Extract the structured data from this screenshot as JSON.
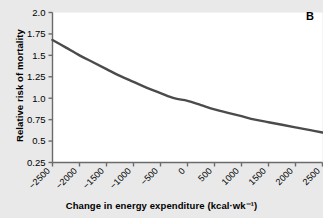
{
  "panel": {
    "label": "B"
  },
  "chart_data": {
    "type": "line",
    "title": "",
    "xlabel": "Change in energy expenditure (kcal·wk⁻¹)",
    "ylabel": "Relative risk of mortality",
    "xlim": [
      -2500,
      2500
    ],
    "ylim": [
      0.25,
      2.0
    ],
    "grid": false,
    "legend": null,
    "xticks": [
      -2500,
      -2000,
      -1500,
      -1000,
      -500,
      0,
      500,
      1000,
      1500,
      2000,
      2500
    ],
    "xticklabels": [
      "−2500",
      "−2000",
      "−1500",
      "−1000",
      "−500",
      "0",
      "500",
      "1000",
      "1500",
      "2000",
      "2500"
    ],
    "yticks": [
      0.25,
      0.5,
      0.75,
      1.0,
      1.25,
      1.5,
      1.75,
      2.0
    ],
    "yticklabels": [
      "0.25",
      "0.5",
      "0.75",
      "1.0",
      "1.25",
      "1.5",
      "1.75",
      "2.0"
    ],
    "series": [
      {
        "name": "Relative risk of mortality",
        "color": "#4b4b4b",
        "linewidth": 2.4,
        "x": [
          -2500,
          -2250,
          -2000,
          -1750,
          -1500,
          -1250,
          -1000,
          -750,
          -500,
          -250,
          0,
          250,
          500,
          750,
          1000,
          1250,
          1500,
          1750,
          2000,
          2250,
          2500
        ],
        "y": [
          1.68,
          1.59,
          1.5,
          1.42,
          1.34,
          1.26,
          1.19,
          1.12,
          1.06,
          1.0,
          0.97,
          0.92,
          0.87,
          0.83,
          0.79,
          0.75,
          0.72,
          0.69,
          0.66,
          0.63,
          0.6
        ]
      }
    ]
  },
  "colors": {
    "background": "#e9e9e9",
    "plot_area": "#ffffff",
    "axis": "#6b6b6b",
    "line": "#4b4b4b",
    "text": "#000000"
  }
}
